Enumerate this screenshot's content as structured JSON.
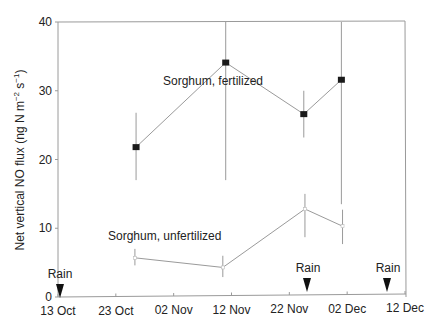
{
  "chart_data": {
    "type": "line",
    "title": "",
    "xlabel": "",
    "ylabel": "Net vertical NO flux (ng N m^-2 s^-1)",
    "ylabel_parts": {
      "main": "Net vertical NO  flux (ng N m",
      "sup1": "−2",
      "mid": " s",
      "sup2": "−1",
      "end": ")"
    },
    "ylim": [
      0,
      40
    ],
    "yticks": [
      0,
      10,
      20,
      30,
      40
    ],
    "xticks": [
      "13 Oct",
      "23 Oct",
      "02 Nov",
      "12 Nov",
      "22 Nov",
      "02 Dec",
      "12 Dec"
    ],
    "xtick_days": [
      0,
      10,
      20,
      30,
      40,
      50,
      60
    ],
    "grid": false,
    "series": [
      {
        "name": "Sorghum, fertilized",
        "marker": "filled-square",
        "x_days": [
          13.5,
          29,
          42.5,
          49
        ],
        "dates": [
          "26 Oct",
          "11 Nov",
          "25 Nov",
          "01 Dec"
        ],
        "values": [
          21.8,
          34.1,
          26.6,
          31.6
        ],
        "err_low": [
          17.0,
          17.0,
          23.2,
          13.5
        ],
        "err_high": [
          26.8,
          40.0,
          30.0,
          40.0
        ]
      },
      {
        "name": "Sorghum, unfertilized",
        "marker": "open-square",
        "x_days": [
          13.3,
          28.5,
          42.7,
          49.2
        ],
        "dates": [
          "26 Oct",
          "10 Nov",
          "25 Nov",
          "01 Dec"
        ],
        "values": [
          5.7,
          4.3,
          12.8,
          10.3
        ],
        "err_low": [
          4.6,
          2.9,
          8.7,
          7.7
        ],
        "err_high": [
          7.0,
          6.0,
          15.0,
          12.7
        ]
      }
    ],
    "annotations": [
      {
        "text": "Sorghum, fertilized",
        "near_series": 0
      },
      {
        "text": "Sorghum, unfertilized",
        "near_series": 1
      },
      {
        "text": "Rain",
        "marker": "down-arrow",
        "x_day": 0
      },
      {
        "text": "Rain",
        "marker": "down-arrow",
        "x_day": 43
      },
      {
        "text": "Rain",
        "marker": "down-arrow",
        "x_day": 57.5
      }
    ]
  }
}
